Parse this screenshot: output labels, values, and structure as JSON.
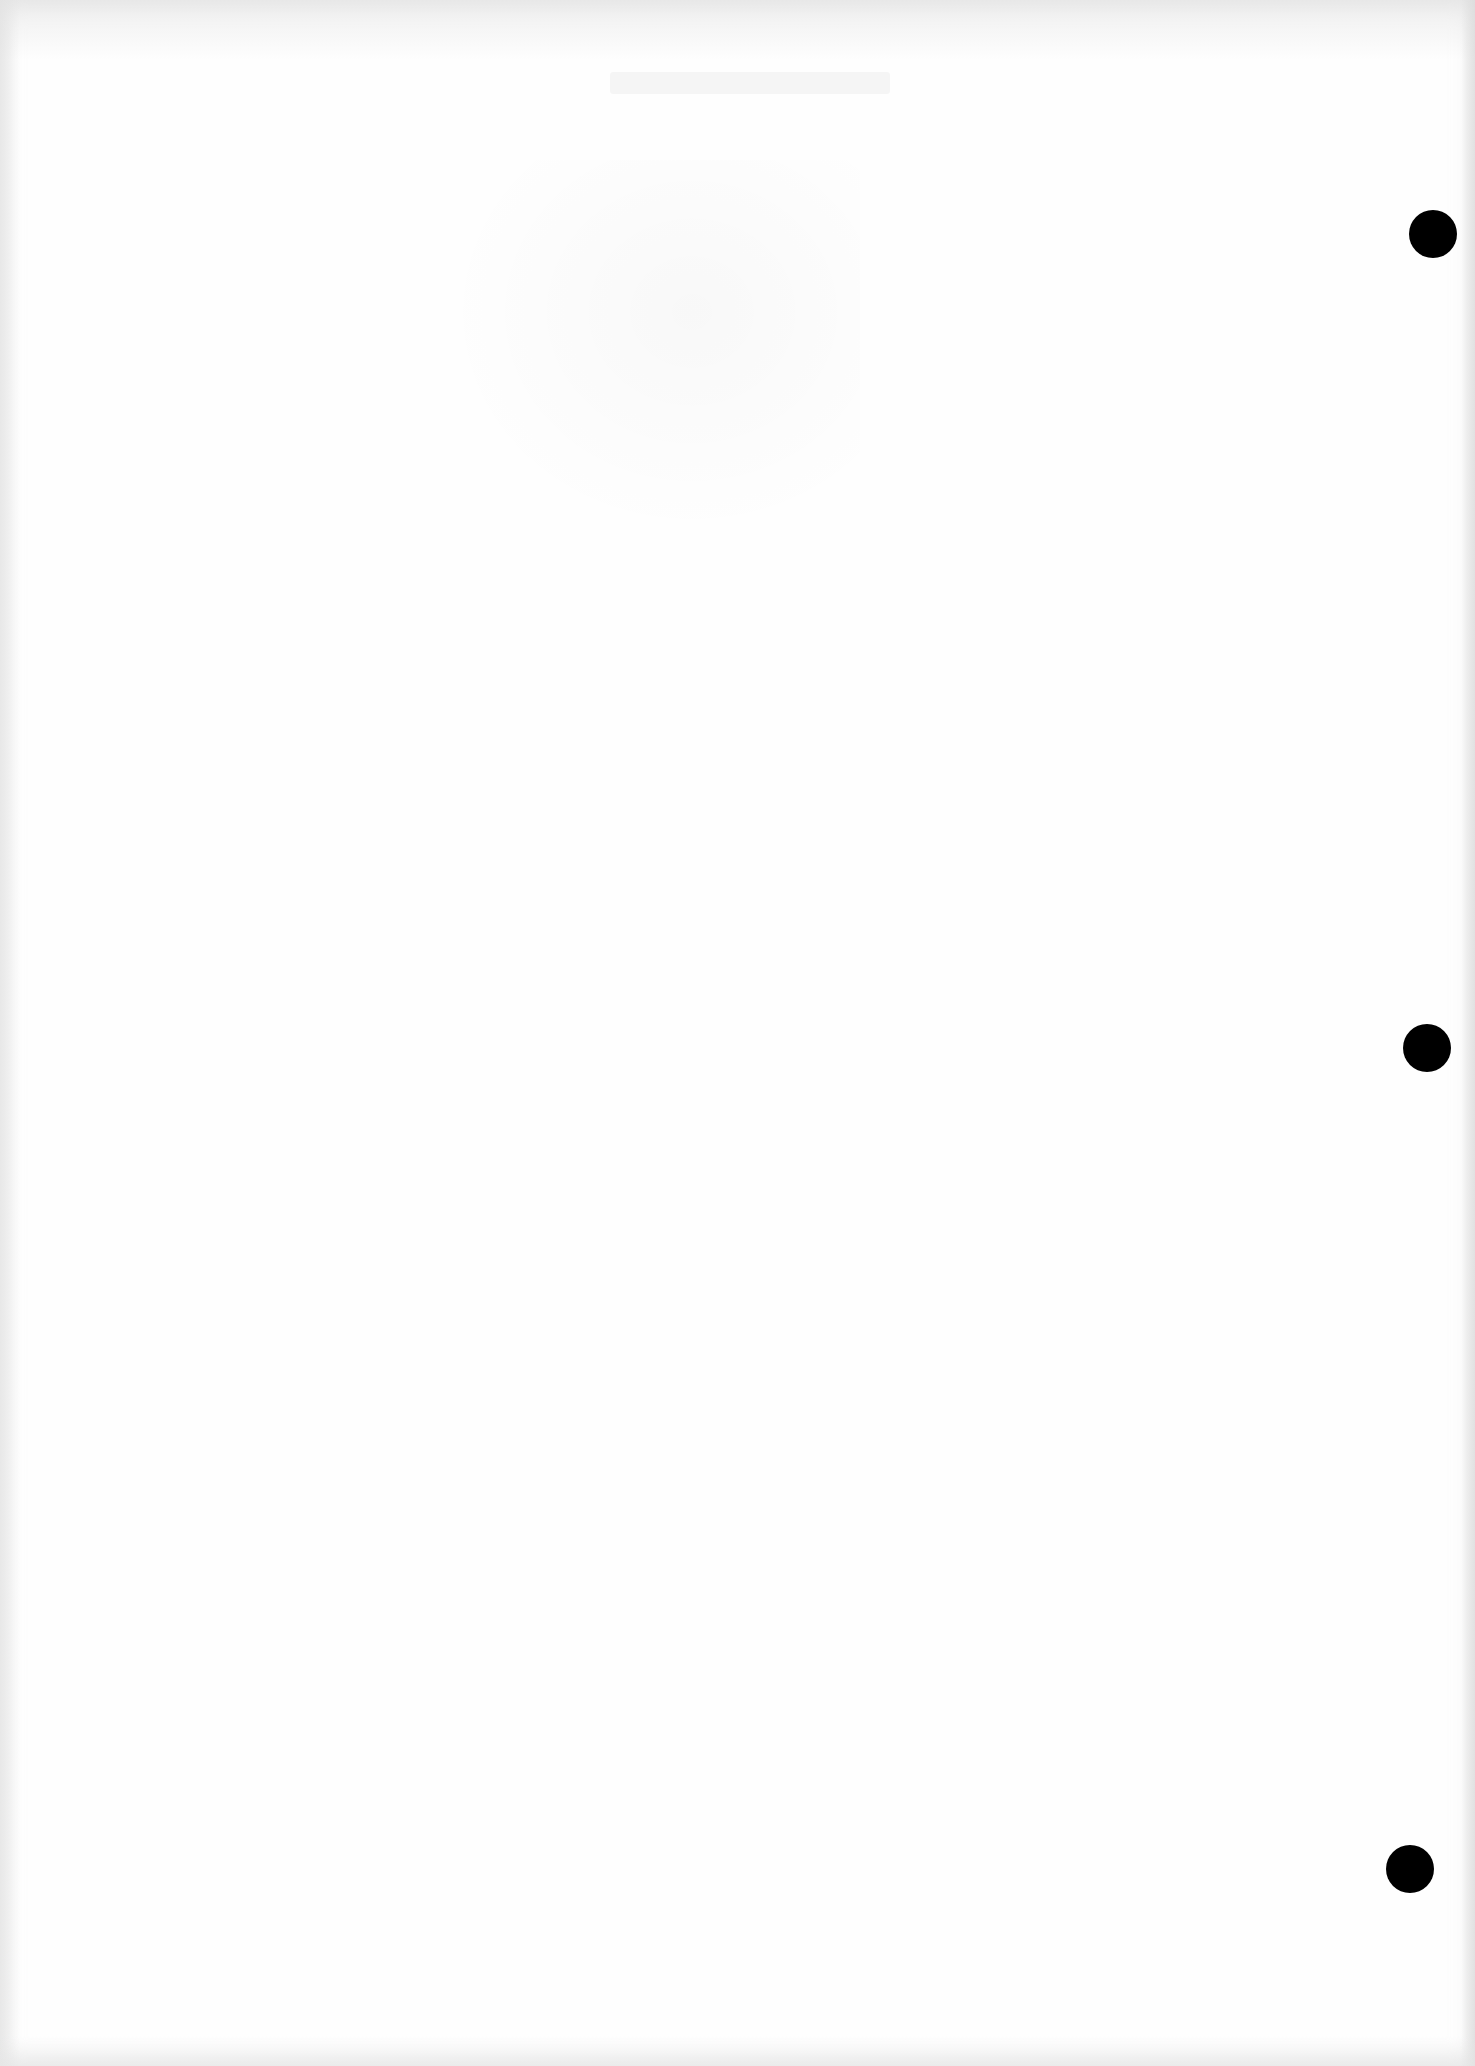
{
  "document": {
    "type": "scanned blank sheet",
    "background_color": "#fefefe",
    "visible_text": [],
    "show_through": {
      "legible": false,
      "regions": [
        {
          "x": 610,
          "y": 70,
          "w": 280,
          "h": 30
        },
        {
          "x": 440,
          "y": 160,
          "w": 420,
          "h": 380
        }
      ]
    },
    "hole_punches": [
      {
        "name": "hole-punch-top",
        "cx": 1433,
        "cy": 234,
        "r": 24,
        "color": "#000000"
      },
      {
        "name": "hole-punch-middle",
        "cx": 1427,
        "cy": 1048,
        "r": 24,
        "color": "#000000"
      },
      {
        "name": "hole-punch-bottom",
        "cx": 1410,
        "cy": 1869,
        "r": 24,
        "color": "#000000"
      }
    ]
  }
}
